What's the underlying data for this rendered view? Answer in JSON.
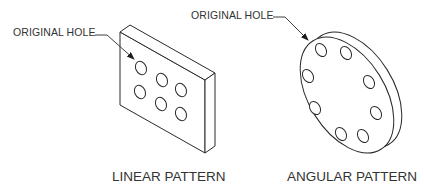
{
  "diagram": {
    "linear": {
      "callout": "ORIGINAL HOLE",
      "caption": "LINEAR PATTERN",
      "hole_count": 6
    },
    "angular": {
      "callout": "ORIGINAL HOLE",
      "caption": "ANGULAR PATTERN",
      "hole_count": 8
    },
    "colors": {
      "line": "#2a2a2a",
      "text": "#333333",
      "background": "#ffffff"
    }
  }
}
